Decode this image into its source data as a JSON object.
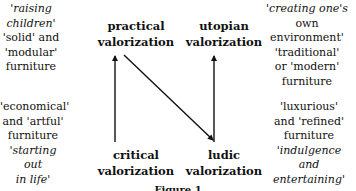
{
  "diagram": {
    "nodes": {
      "practical": {
        "line1": "practical",
        "line2": "valorization"
      },
      "utopian": {
        "line1": "utopian",
        "line2": "valorization"
      },
      "critical": {
        "line1": "critical",
        "line2": "valorization"
      },
      "ludic": {
        "line1": "ludic",
        "line2": "valorization"
      }
    },
    "annotations": {
      "top_left": {
        "italic": [
          "'raising",
          "children'"
        ],
        "roman": [
          "'solid' and",
          "'modular'",
          "furniture"
        ]
      },
      "top_right": {
        "italic": [
          "'creating one's"
        ],
        "roman": [
          "own environment'",
          "'traditional'",
          "or 'modern'",
          "furniture"
        ]
      },
      "bottom_left": {
        "roman": [
          "'economical'",
          "and 'artful'",
          "furniture"
        ],
        "italic": [
          "'starting out",
          "in life'"
        ]
      },
      "bottom_right": {
        "roman": [
          "'luxurious'",
          "and 'refined'",
          "furniture"
        ],
        "italic": [
          "'indulgence",
          "and entertaining'"
        ]
      }
    },
    "edges": [
      {
        "from": "critical",
        "to": "practical"
      },
      {
        "from": "practical",
        "to": "ludic"
      },
      {
        "from": "ludic",
        "to": "utopian"
      }
    ],
    "caption": "Figure 1"
  }
}
